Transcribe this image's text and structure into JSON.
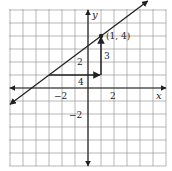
{
  "chart_data": {
    "type": "line",
    "title": "",
    "xlabel": "x",
    "ylabel": "y",
    "xlim": [
      -6,
      6
    ],
    "ylim": [
      -6,
      6
    ],
    "grid": true,
    "x_tick_labels": [
      {
        "value": -2,
        "label": "−2"
      },
      {
        "value": 2,
        "label": "2"
      }
    ],
    "y_tick_labels": [
      {
        "value": 2,
        "label": "2"
      },
      {
        "value": -2,
        "label": "−2"
      }
    ],
    "series": [
      {
        "name": "line",
        "equation": "y = (3/4)x + 13/4",
        "slope": 0.75,
        "intercept": 3.25,
        "x": [
          -6,
          4
        ],
        "y": [
          -1.25,
          6.25
        ],
        "arrows_both_ends": true
      }
    ],
    "points": [
      {
        "x": 1,
        "y": 4,
        "label": "(1, 4)"
      }
    ],
    "annotations": [
      {
        "type": "arrow",
        "from": [
          -3,
          1
        ],
        "to": [
          1,
          1
        ],
        "label": "4",
        "meaning": "run"
      },
      {
        "type": "arrow",
        "from": [
          1,
          1
        ],
        "to": [
          1,
          4
        ],
        "label": "3",
        "meaning": "rise"
      }
    ]
  },
  "labels": {
    "x_axis": "x",
    "y_axis": "y",
    "x_tick_neg2": "−2",
    "x_tick_2": "2",
    "y_tick_2": "2",
    "y_tick_neg2": "−2",
    "point": "(1, 4)",
    "run": "4",
    "rise": "3"
  },
  "colors": {
    "grid": "#9a9a9a",
    "axis": "#222222",
    "line": "#222222",
    "background": "#ffffff"
  }
}
